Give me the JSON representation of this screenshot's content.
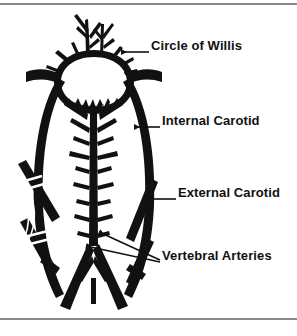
{
  "figure": {
    "style": "black-and-white anatomical line illustration",
    "background_color": "#ffffff",
    "ink_color": "#111111",
    "rule_color": "#8a8a8a",
    "labels": [
      {
        "id": "circle-of-willis",
        "text": "Circle of Willis",
        "leader": "arrow-left",
        "points_to": "arterial ring at top of diagram"
      },
      {
        "id": "internal-carotid",
        "text": "Internal Carotid",
        "leader": "arrow-left",
        "points_to": "right long vertical vessel"
      },
      {
        "id": "external-carotid",
        "text": "External Carotid",
        "leader": "arrow-left",
        "points_to": "short oblique branch vessel on right"
      },
      {
        "id": "vertebral-arteries",
        "text": "Vertebral Arteries",
        "leader": "double-arrow-left",
        "points_to": "paired vessels converging at lower center"
      }
    ],
    "structures": [
      "circle of willis arterial ring",
      "cerebral branch vessels",
      "basilar artery with segmental branches",
      "internal carotid arteries",
      "external carotid arteries",
      "vertebral arteries",
      "surgical cut marks"
    ]
  }
}
